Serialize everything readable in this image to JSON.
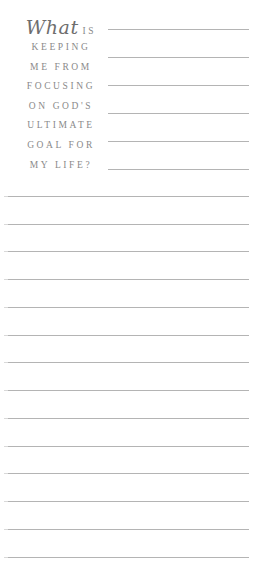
{
  "prompt": {
    "script_word": "What",
    "first_line_rest": "IS",
    "lines": [
      "KEEPING",
      "ME FROM",
      "FOCUSING",
      "ON GOD'S",
      "ULTIMATE",
      "GOAL FOR",
      "MY LIFE?"
    ]
  },
  "writing_lines": {
    "short_lines_y": [
      29,
      57,
      85,
      113,
      141,
      169
    ],
    "full_lines_y": [
      196,
      224,
      251,
      279,
      307,
      335,
      362,
      390,
      418,
      446,
      473,
      501,
      529,
      557
    ],
    "line_color": "#b4b4b4"
  }
}
